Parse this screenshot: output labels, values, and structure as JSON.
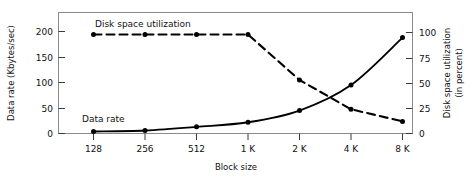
{
  "chart_data": {
    "type": "line",
    "title": "",
    "xlabel": "Block size",
    "categories": [
      "128",
      "256",
      "512",
      "1 K",
      "2 K",
      "4 K",
      "8 K"
    ],
    "grid": false,
    "legend_position": "inline-annotation",
    "axes": {
      "x": {
        "label": "Block size",
        "ticks": [
          "128",
          "256",
          "512",
          "1 K",
          "2 K",
          "4 K",
          "8 K"
        ]
      },
      "left": {
        "label": "Data rate (Kbytes/sec)",
        "label_line1": "Data rate (Kbytes/sec)",
        "ticks": [
          "0",
          "50",
          "100",
          "150",
          "200"
        ],
        "tick_values": [
          0,
          50,
          100,
          150,
          200
        ],
        "lim": [
          0,
          225
        ]
      },
      "right": {
        "label": "Disk space utilization (in percent)",
        "label_line1": "Disk space utilization",
        "label_line2": "(in percent)",
        "ticks": [
          "0",
          "25",
          "50",
          "75",
          "100"
        ],
        "tick_values": [
          0,
          25,
          50,
          75,
          100
        ],
        "lim": [
          0,
          112
        ]
      }
    },
    "series": [
      {
        "name": "Data rate",
        "annotation": "Data rate",
        "axis": "left",
        "style": "solid",
        "color": "#000000",
        "marker": "filled-circle",
        "values": [
          4,
          6,
          13,
          22,
          45,
          95,
          188
        ]
      },
      {
        "name": "Disk space utilization",
        "annotation": "Disk space utilization",
        "axis": "right",
        "style": "dashed",
        "color": "#000000",
        "marker": "filled-circle",
        "values": [
          98,
          98,
          98,
          98,
          53,
          24,
          12
        ]
      }
    ]
  },
  "colors": {
    "frame": "#8a8a8a",
    "ink": "#000000",
    "background": "#ffffff"
  }
}
